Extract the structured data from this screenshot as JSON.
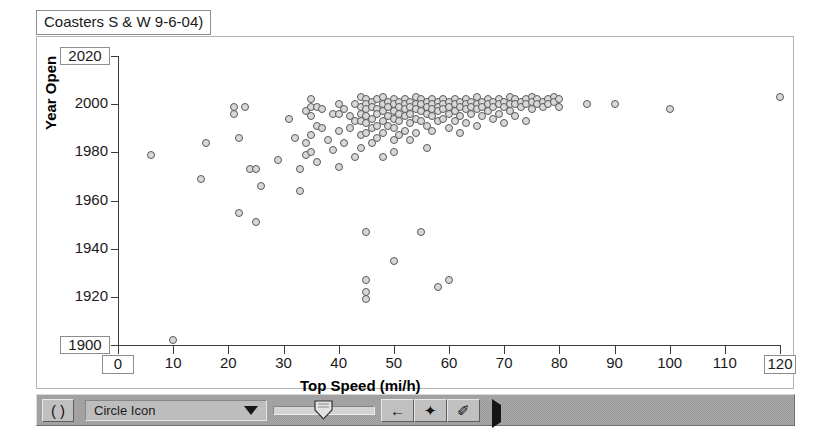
{
  "window": {
    "title": "Coasters S & W 9-6-04)"
  },
  "chart_data": {
    "type": "scatter",
    "title": "Coasters S & W 9-6-04)",
    "xlabel": "Top Speed (mi/h)",
    "ylabel": "Year Open",
    "xlim": [
      0,
      120
    ],
    "ylim": [
      1900,
      2020
    ],
    "xticks": [
      0,
      10,
      20,
      30,
      40,
      50,
      60,
      70,
      80,
      90,
      100,
      110,
      120
    ],
    "yticks": [
      1900,
      1920,
      1940,
      1960,
      1980,
      2000,
      2020
    ],
    "grid": false,
    "legend": false,
    "marker": {
      "shape": "circle",
      "fill": "#d8d8d8",
      "edge": "#59595d",
      "size": 8
    },
    "points": [
      [
        6,
        1979
      ],
      [
        10,
        1902
      ],
      [
        15,
        1969
      ],
      [
        16,
        1984
      ],
      [
        21,
        1999
      ],
      [
        21,
        1996
      ],
      [
        22,
        1986
      ],
      [
        22,
        1955
      ],
      [
        23,
        1999
      ],
      [
        24,
        1973
      ],
      [
        25,
        1973
      ],
      [
        25,
        1951
      ],
      [
        26,
        1966
      ],
      [
        29,
        1977
      ],
      [
        31,
        1994
      ],
      [
        32,
        1986
      ],
      [
        33,
        1973
      ],
      [
        33,
        1964
      ],
      [
        34,
        1997
      ],
      [
        34,
        1984
      ],
      [
        34,
        1979
      ],
      [
        35,
        2002
      ],
      [
        35,
        1999
      ],
      [
        35,
        1995
      ],
      [
        35,
        1987
      ],
      [
        35,
        1980
      ],
      [
        36,
        1999
      ],
      [
        36,
        1991
      ],
      [
        36,
        1976
      ],
      [
        37,
        1998
      ],
      [
        37,
        1990
      ],
      [
        38,
        1985
      ],
      [
        39,
        1996
      ],
      [
        39,
        1981
      ],
      [
        40,
        2000
      ],
      [
        40,
        1996
      ],
      [
        40,
        1989
      ],
      [
        40,
        1974
      ],
      [
        41,
        1998
      ],
      [
        41,
        1984
      ],
      [
        42,
        1995
      ],
      [
        42,
        1990
      ],
      [
        43,
        2000
      ],
      [
        43,
        1993
      ],
      [
        43,
        1978
      ],
      [
        44,
        2003
      ],
      [
        44,
        1999
      ],
      [
        44,
        1996
      ],
      [
        44,
        1993
      ],
      [
        44,
        1987
      ],
      [
        44,
        1982
      ],
      [
        45,
        2002
      ],
      [
        45,
        2000
      ],
      [
        45,
        1998
      ],
      [
        45,
        1995
      ],
      [
        45,
        1992
      ],
      [
        45,
        1988
      ],
      [
        45,
        1947
      ],
      [
        45,
        1927
      ],
      [
        45,
        1922
      ],
      [
        45,
        1919
      ],
      [
        46,
        2001
      ],
      [
        46,
        1999
      ],
      [
        46,
        1994
      ],
      [
        46,
        1990
      ],
      [
        46,
        1984
      ],
      [
        47,
        2002
      ],
      [
        47,
        1998
      ],
      [
        47,
        1996
      ],
      [
        47,
        1991
      ],
      [
        47,
        1986
      ],
      [
        48,
        2003
      ],
      [
        48,
        2000
      ],
      [
        48,
        1997
      ],
      [
        48,
        1993
      ],
      [
        48,
        1988
      ],
      [
        48,
        1978
      ],
      [
        49,
        2001
      ],
      [
        49,
        1999
      ],
      [
        49,
        1995
      ],
      [
        49,
        1991
      ],
      [
        50,
        2002
      ],
      [
        50,
        2000
      ],
      [
        50,
        1997
      ],
      [
        50,
        1994
      ],
      [
        50,
        1990
      ],
      [
        50,
        1985
      ],
      [
        50,
        1980
      ],
      [
        50,
        1935
      ],
      [
        51,
        2001
      ],
      [
        51,
        1999
      ],
      [
        51,
        1996
      ],
      [
        51,
        1993
      ],
      [
        51,
        1987
      ],
      [
        52,
        2002
      ],
      [
        52,
        2000
      ],
      [
        52,
        1998
      ],
      [
        52,
        1995
      ],
      [
        52,
        1989
      ],
      [
        53,
        2001
      ],
      [
        53,
        1999
      ],
      [
        53,
        1996
      ],
      [
        53,
        1992
      ],
      [
        53,
        1985
      ],
      [
        54,
        2003
      ],
      [
        54,
        2000
      ],
      [
        54,
        1998
      ],
      [
        54,
        1994
      ],
      [
        54,
        1988
      ],
      [
        55,
        2002
      ],
      [
        55,
        2000
      ],
      [
        55,
        1997
      ],
      [
        55,
        1993
      ],
      [
        55,
        1947
      ],
      [
        56,
        2001
      ],
      [
        56,
        1999
      ],
      [
        56,
        1996
      ],
      [
        56,
        1991
      ],
      [
        56,
        1982
      ],
      [
        57,
        2002
      ],
      [
        57,
        2000
      ],
      [
        57,
        1998
      ],
      [
        57,
        1995
      ],
      [
        57,
        1989
      ],
      [
        58,
        2001
      ],
      [
        58,
        1999
      ],
      [
        58,
        1997
      ],
      [
        58,
        1993
      ],
      [
        58,
        1924
      ],
      [
        59,
        2002
      ],
      [
        59,
        2000
      ],
      [
        59,
        1998
      ],
      [
        59,
        1994
      ],
      [
        60,
        2001
      ],
      [
        60,
        1999
      ],
      [
        60,
        1996
      ],
      [
        60,
        1990
      ],
      [
        60,
        1927
      ],
      [
        61,
        2002
      ],
      [
        61,
        2000
      ],
      [
        61,
        1997
      ],
      [
        61,
        1993
      ],
      [
        62,
        2001
      ],
      [
        62,
        1999
      ],
      [
        62,
        1995
      ],
      [
        62,
        1988
      ],
      [
        63,
        2002
      ],
      [
        63,
        2000
      ],
      [
        63,
        1998
      ],
      [
        63,
        1992
      ],
      [
        64,
        2001
      ],
      [
        64,
        1999
      ],
      [
        64,
        1996
      ],
      [
        65,
        2003
      ],
      [
        65,
        2000
      ],
      [
        65,
        1998
      ],
      [
        65,
        1991
      ],
      [
        66,
        2001
      ],
      [
        66,
        1999
      ],
      [
        66,
        1995
      ],
      [
        67,
        2002
      ],
      [
        67,
        2000
      ],
      [
        67,
        1997
      ],
      [
        68,
        2001
      ],
      [
        68,
        1999
      ],
      [
        68,
        1994
      ],
      [
        69,
        2002
      ],
      [
        69,
        2000
      ],
      [
        69,
        1996
      ],
      [
        70,
        2001
      ],
      [
        70,
        1999
      ],
      [
        70,
        1992
      ],
      [
        71,
        2003
      ],
      [
        71,
        2000
      ],
      [
        71,
        1997
      ],
      [
        72,
        2002
      ],
      [
        72,
        2000
      ],
      [
        72,
        1995
      ],
      [
        73,
        2001
      ],
      [
        73,
        1999
      ],
      [
        74,
        2002
      ],
      [
        74,
        2000
      ],
      [
        74,
        1993
      ],
      [
        75,
        2003
      ],
      [
        75,
        2001
      ],
      [
        75,
        1998
      ],
      [
        76,
        2002
      ],
      [
        76,
        2000
      ],
      [
        77,
        2001
      ],
      [
        77,
        1999
      ],
      [
        78,
        2002
      ],
      [
        78,
        2000
      ],
      [
        79,
        2003
      ],
      [
        79,
        2001
      ],
      [
        80,
        2002
      ],
      [
        80,
        1999
      ],
      [
        85,
        2000
      ],
      [
        90,
        2000
      ],
      [
        100,
        1998
      ],
      [
        120,
        2003
      ]
    ]
  },
  "toolbar": {
    "rotate_icon": "( )",
    "icon_selector_value": "Circle Icon",
    "dropdown_icon": "triangle-down",
    "slider_value": 40,
    "buttons": [
      {
        "name": "back-arrow",
        "glyph": "←"
      },
      {
        "name": "diamond",
        "glyph": "✦"
      },
      {
        "name": "pencil",
        "glyph": "✐"
      }
    ],
    "play_icon": "triangle-right"
  }
}
